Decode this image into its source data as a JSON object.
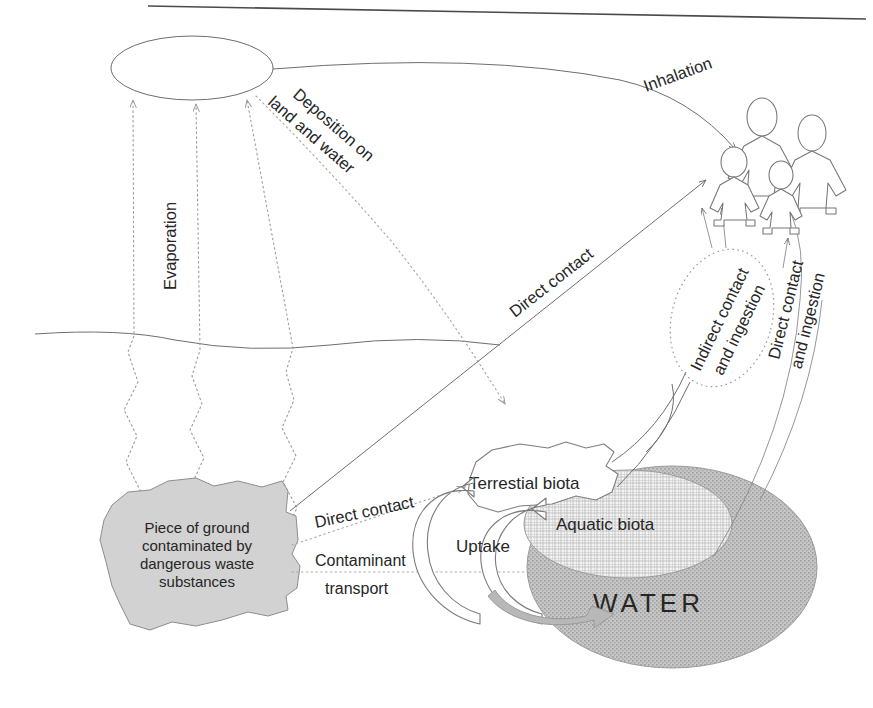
{
  "diagram": {
    "nodes": {
      "atmosphere": "Atmosphere",
      "ground_surface": "Ground surface",
      "contaminated_ground": "Piece of ground contaminated by dangerous waste substances",
      "contaminated_ground_lines": [
        "Piece of ground",
        "contaminated by",
        "dangerous waste",
        "substances"
      ],
      "terrestial_biota": "Terrestial biota",
      "aquatic_biota": "Aquatic biota",
      "water": "WATER",
      "receptor": "family of four people"
    },
    "flows": {
      "evaporation": "Evaporation",
      "deposition": "Deposition on land and water",
      "deposition_lines": [
        "Deposition on",
        "land and water"
      ],
      "inhalation": "Inhalation",
      "direct_contact_ground": "Direct contact",
      "direct_contact_biota": "Direct contact",
      "indirect_contact": "Indirect contact and ingestion",
      "indirect_contact_lines": [
        "Indirect contact",
        "and ingestion"
      ],
      "direct_contact_ingestion": "Direct contact and ingestion",
      "direct_contact_ingestion_lines": [
        "Direct contact",
        "and ingestion"
      ],
      "contaminant_transport": "Contaminant transport",
      "contaminant_transport_lines": [
        "Contaminant",
        "transport"
      ],
      "uptake": "Uptake"
    },
    "colors": {
      "background": "#ffffff",
      "ink": "#262626",
      "line": "#6e6e6e",
      "dotted": "#9a9a9a",
      "contaminated_fill": "#d2d2d2",
      "water_fill": "#bdbdbd",
      "aquatic_fill": "#e8e8e8",
      "page_rule": "#4a4a4a"
    }
  }
}
